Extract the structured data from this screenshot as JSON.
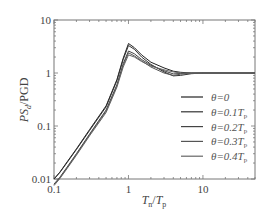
{
  "chart_data": {
    "type": "line",
    "title": "",
    "xlabel": "T_n/T_p",
    "ylabel": "PS_d/PGD",
    "xscale": "log",
    "yscale": "log",
    "xlim": [
      0.1,
      50
    ],
    "ylim": [
      0.01,
      10
    ],
    "xticks": [
      "0.1",
      "1",
      "10"
    ],
    "yticks": [
      "0.01",
      "0.1",
      "1",
      "10"
    ],
    "grid": false,
    "legend_position": "lower right",
    "x": [
      0.1,
      0.12,
      0.15,
      0.2,
      0.3,
      0.5,
      0.7,
      0.85,
      1.0,
      1.2,
      1.5,
      2.0,
      3.0,
      4.0,
      5.0,
      7.0,
      10.0,
      20.0,
      50.0
    ],
    "series": [
      {
        "name": "θ=0",
        "label_main": "θ=0",
        "label_sub": "",
        "color": "#222222",
        "values": [
          0.01,
          0.0135,
          0.021,
          0.037,
          0.085,
          0.24,
          0.75,
          1.9,
          3.6,
          3.0,
          2.2,
          1.6,
          1.25,
          1.08,
          1.03,
          1.0,
          1.0,
          1.0,
          1.0
        ]
      },
      {
        "name": "θ=0.1Tp",
        "label_main": "θ=0.1",
        "label_sub": "p",
        "color": "#333333",
        "values": [
          0.01,
          0.0133,
          0.0205,
          0.036,
          0.082,
          0.23,
          0.72,
          1.8,
          3.3,
          2.8,
          2.0,
          1.45,
          1.05,
          0.88,
          0.9,
          0.97,
          1.0,
          1.0,
          1.0
        ]
      },
      {
        "name": "θ=0.2Tp",
        "label_main": "θ=0.2",
        "label_sub": "p",
        "color": "#444444",
        "values": [
          0.008,
          0.0108,
          0.0168,
          0.03,
          0.07,
          0.2,
          0.6,
          1.5,
          2.6,
          2.3,
          1.8,
          1.4,
          1.1,
          0.96,
          0.98,
          1.0,
          1.0,
          1.0,
          1.0
        ]
      },
      {
        "name": "θ=0.3Tp",
        "label_main": "θ=0.3",
        "label_sub": "p",
        "color": "#555555",
        "values": [
          0.0078,
          0.0105,
          0.0163,
          0.029,
          0.068,
          0.19,
          0.57,
          1.4,
          2.4,
          2.1,
          1.7,
          1.3,
          1.0,
          0.9,
          0.95,
          0.99,
          1.0,
          1.0,
          1.0
        ]
      },
      {
        "name": "θ=0.4Tp",
        "label_main": "θ=0.4",
        "label_sub": "p",
        "color": "#666666",
        "values": [
          0.0075,
          0.0102,
          0.0158,
          0.028,
          0.065,
          0.18,
          0.54,
          1.3,
          2.2,
          2.0,
          1.65,
          1.35,
          1.15,
          1.05,
          1.0,
          1.0,
          1.0,
          1.0,
          1.0
        ]
      }
    ]
  },
  "axes": {
    "ylabel_main": "PS",
    "ylabel_sub": "d",
    "ylabel_rest": "/PGD",
    "xlabel_t1": "T",
    "xlabel_s1": "n",
    "xlabel_mid": "/",
    "xlabel_t2": "T",
    "xlabel_s2": "p"
  }
}
